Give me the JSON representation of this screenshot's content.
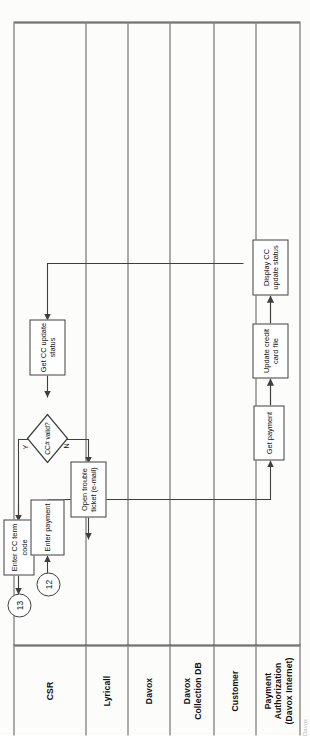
{
  "document": {
    "type": "swimlane-flowchart",
    "orientation": "landscape-on-portrait-page",
    "page_edge_artifact": "Davox"
  },
  "lanes": [
    {
      "id": "csr",
      "label": "CSR"
    },
    {
      "id": "lyricall",
      "label": "Lyricall"
    },
    {
      "id": "davox",
      "label": "Davox"
    },
    {
      "id": "davoxdb",
      "label": "Davox\nCollection DB"
    },
    {
      "id": "customer",
      "label": "Customer"
    },
    {
      "id": "payauth",
      "label": "Payment\nAuthorization\n(Davox Internet)"
    }
  ],
  "nodes": [
    {
      "id": "c12",
      "kind": "connector",
      "lane": "csr",
      "label": "12"
    },
    {
      "id": "enterpay",
      "kind": "process",
      "lane": "csr",
      "label": "Enter  payment"
    },
    {
      "id": "getccst",
      "kind": "process",
      "lane": "csr",
      "label": "Get CC  update status"
    },
    {
      "id": "ccvalid",
      "kind": "decision",
      "lane": "csr",
      "label": "CC# valid?"
    },
    {
      "id": "trouble",
      "kind": "process",
      "lane": "csr",
      "label": "Open trouble ticket (e-mail)"
    },
    {
      "id": "entercc",
      "kind": "process",
      "lane": "csr",
      "label": "Enter CC term code"
    },
    {
      "id": "c13",
      "kind": "connector",
      "lane": "csr",
      "label": "13"
    },
    {
      "id": "getpay",
      "kind": "process",
      "lane": "payauth",
      "label": "Get payment"
    },
    {
      "id": "updcc",
      "kind": "process",
      "lane": "payauth",
      "label": "Update credit card file"
    },
    {
      "id": "dispcc",
      "kind": "process",
      "lane": "payauth",
      "label": "Display CC update status"
    }
  ],
  "edge_labels": {
    "yes": "Y",
    "no": "N"
  },
  "colors": {
    "lane_border": "#4a4a4a",
    "node_border": "#3f3f3f",
    "edge": "#3f3f3f",
    "text": "#111111",
    "page": "#fdfdfc"
  }
}
